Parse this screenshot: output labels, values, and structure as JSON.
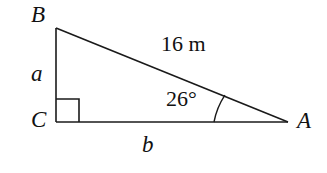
{
  "figure": {
    "kind": "right-triangle-diagram",
    "background_color": "#ffffff",
    "stroke_color": "#1a1a1a",
    "vertices": {
      "B": {
        "label": "B",
        "x": 56,
        "y": 28
      },
      "C": {
        "label": "C",
        "x": 56,
        "y": 122
      },
      "A": {
        "label": "A",
        "x": 288,
        "y": 122
      }
    },
    "sides": {
      "vertical_leg": {
        "label": "a",
        "from": "B",
        "to": "C"
      },
      "horizontal_leg": {
        "label": "b",
        "from": "C",
        "to": "A"
      },
      "hypotenuse": {
        "label": "16 m",
        "from": "B",
        "to": "A"
      }
    },
    "angles": {
      "at_A": {
        "label": "26°",
        "value": 26,
        "unit": "degrees"
      },
      "at_C": {
        "label": "",
        "marker": "right-angle-square",
        "value": 90,
        "unit": "degrees"
      }
    },
    "markers": {
      "right_angle_square": {
        "x": 56,
        "y": 99,
        "size": 23
      },
      "angle_arc": {
        "center_x": 288,
        "center_y": 122,
        "radius": 74
      }
    }
  }
}
